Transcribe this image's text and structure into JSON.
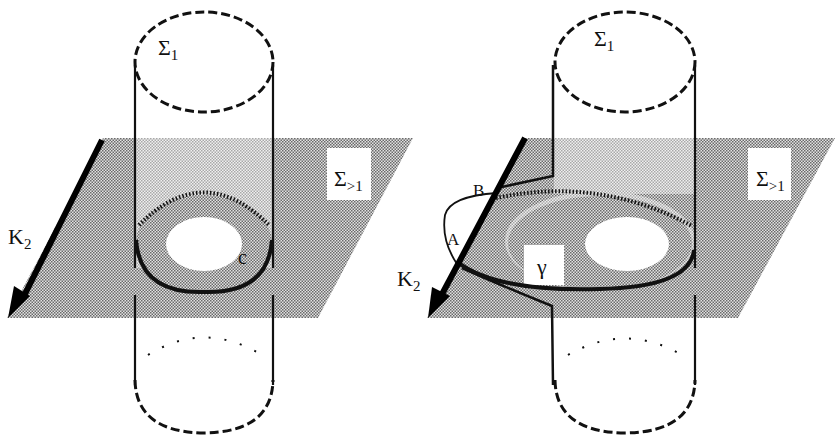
{
  "figure": {
    "left_panel": {
      "labels": {
        "sigma1": "Σ",
        "sigma1_sub": "1",
        "sigma_gt1": "Σ",
        "sigma_gt1_sub": ">1",
        "k2": "K",
        "k2_sub": "2",
        "curve": "c"
      }
    },
    "right_panel": {
      "labels": {
        "sigma1": "Σ",
        "sigma1_sub": "1",
        "sigma_gt1": "Σ",
        "sigma_gt1_sub": ">1",
        "k2": "K",
        "k2_sub": "2",
        "point_a": "A",
        "point_b": "B",
        "curve": "γ"
      }
    },
    "colors": {
      "plane": "#bdbdbd",
      "plane_inside": "#d8d8d8",
      "ink": "#111111",
      "background": "#ffffff"
    }
  }
}
